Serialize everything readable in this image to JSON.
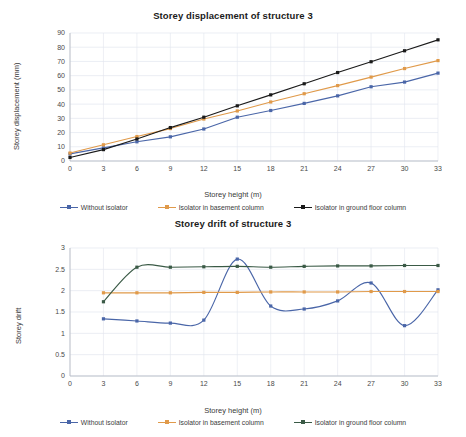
{
  "colors": {
    "without_isolator": "#4a66a8",
    "isolator_basement": "#e09a4a",
    "isolator_ground_displacement": "#1a1a1a",
    "isolator_ground_drift": "#3a5a46",
    "grid": "#e2e6ef",
    "axis": "#b8bcc6",
    "title": "#1b1b1b"
  },
  "legend": {
    "without_isolator": "Without isolator",
    "isolator_basement": "Isolator in basement column",
    "isolator_ground": "Isolator in ground floor column"
  },
  "caption": {
    "text": ""
  },
  "chart_data": [
    {
      "id": "storey-displacement",
      "type": "line",
      "title": "Storey displacement of structure 3",
      "xlabel": "Storey height (m)",
      "ylabel": "Storey displacement (mm)",
      "x": [
        0,
        3,
        6,
        9,
        12,
        15,
        18,
        21,
        24,
        27,
        30,
        33
      ],
      "xticks": [
        "0",
        "3",
        "6",
        "9",
        "12",
        "15",
        "18",
        "21",
        "24",
        "27",
        "30",
        "33"
      ],
      "yticks": [
        "0",
        "10",
        "20",
        "30",
        "40",
        "50",
        "60",
        "70",
        "80",
        "90"
      ],
      "xlim": [
        0,
        33
      ],
      "ylim": [
        0,
        90
      ],
      "grid": true,
      "legend_position": "bottom",
      "series": [
        {
          "name": "Without isolator",
          "color": "#4a66a8",
          "marker": "square",
          "values": [
            5.0,
            9.2,
            13.5,
            17.0,
            22.5,
            30.8,
            35.5,
            40.5,
            45.8,
            52.2,
            55.5,
            61.8
          ]
        },
        {
          "name": "Isolator in basement column",
          "color": "#e09a4a",
          "marker": "square",
          "values": [
            5.6,
            11.4,
            17.2,
            22.8,
            29.5,
            35.2,
            41.5,
            47.3,
            53.0,
            59.0,
            65.0,
            70.6
          ]
        },
        {
          "name": "Isolator in ground floor column",
          "color": "#1a1a1a",
          "marker": "square",
          "values": [
            2.5,
            8.0,
            15.5,
            23.5,
            30.8,
            38.8,
            46.5,
            54.3,
            62.2,
            69.8,
            77.5,
            85.2
          ]
        }
      ]
    },
    {
      "id": "storey-drift",
      "type": "line",
      "title": "Storey drift of structure 3",
      "xlabel": "Storey height (m)",
      "ylabel": "Storey drift",
      "x": [
        3,
        6,
        9,
        12,
        15,
        18,
        21,
        24,
        27,
        30,
        33
      ],
      "xticks": [
        "0",
        "3",
        "6",
        "9",
        "12",
        "15",
        "18",
        "21",
        "24",
        "27",
        "30",
        "33"
      ],
      "yticks": [
        "0",
        "0.5",
        "1",
        "1.5",
        "2",
        "2.5",
        "3"
      ],
      "xlim": [
        0,
        33
      ],
      "ylim": [
        0,
        3
      ],
      "grid": true,
      "smooth": true,
      "legend_position": "bottom",
      "series": [
        {
          "name": "Without isolator",
          "color": "#4a66a8",
          "marker": "square",
          "values": [
            1.34,
            1.29,
            1.24,
            1.31,
            2.74,
            1.64,
            1.57,
            1.76,
            2.18,
            1.18,
            2.02
          ]
        },
        {
          "name": "Isolator in basement column",
          "color": "#e09a4a",
          "marker": "square",
          "values": [
            1.95,
            1.95,
            1.95,
            1.96,
            1.96,
            1.97,
            1.97,
            1.97,
            1.98,
            1.98,
            1.98
          ]
        },
        {
          "name": "Isolator in ground floor column",
          "color": "#3a5a46",
          "marker": "square",
          "values": [
            1.74,
            2.55,
            2.55,
            2.56,
            2.57,
            2.55,
            2.57,
            2.58,
            2.58,
            2.59,
            2.59
          ]
        }
      ]
    }
  ]
}
